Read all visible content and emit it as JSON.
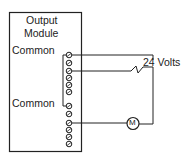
{
  "diagram": {
    "module": {
      "title_line1": "Output",
      "title_line2": "Module",
      "common_label_1": "Common",
      "common_label_2": "Common",
      "terminal_count": 12
    },
    "supply_label": "24  Volts",
    "motor_label": "M",
    "colors": {
      "line": "#222222",
      "background": "#ffffff"
    }
  }
}
